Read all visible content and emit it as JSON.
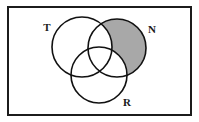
{
  "figure": {
    "type": "venn-diagram",
    "canvas": {
      "width": 199,
      "height": 122,
      "background_color": "#ffffff"
    },
    "universe_rect": {
      "name": "universal-set-rectangle",
      "x": 8,
      "y": 7,
      "width": 183,
      "height": 108,
      "stroke_color": "#1c1c1c",
      "stroke_width": 2,
      "fill_color": "#ffffff"
    },
    "circles": [
      {
        "id": "T",
        "label": "T",
        "cx": 82,
        "cy": 47,
        "r": 30,
        "stroke_color": "#111111",
        "stroke_width": 1.6,
        "fill_color": "none"
      },
      {
        "id": "N",
        "label": "N",
        "cx": 117,
        "cy": 48,
        "r": 29,
        "stroke_color": "#111111",
        "stroke_width": 1.6,
        "fill_color": "none"
      },
      {
        "id": "R",
        "label": "R",
        "cx": 99,
        "cy": 75,
        "r": 28,
        "stroke_color": "#111111",
        "stroke_width": 1.6,
        "fill_color": "none"
      }
    ],
    "labels": [
      {
        "id": "label-T",
        "text": "T",
        "x": 47,
        "y": 31,
        "anchor": "middle"
      },
      {
        "id": "label-N",
        "text": "N",
        "x": 152,
        "y": 33,
        "anchor": "middle"
      },
      {
        "id": "label-R",
        "text": "R",
        "x": 127,
        "y": 106,
        "anchor": "middle"
      }
    ],
    "shaded_region": {
      "id": "shaded-N-only",
      "set_expression": "N − (T ∪ R)",
      "plain_text": "N only",
      "fill_color": "#a8a8a8",
      "opacity": 1
    },
    "unshaded_regions": [
      "T only",
      "R only",
      "T ∩ N only",
      "T ∩ R only",
      "N ∩ R only",
      "T ∩ N ∩ R",
      "outside all circles"
    ]
  }
}
